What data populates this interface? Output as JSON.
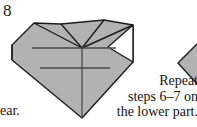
{
  "page": {
    "background_color": "#ffffff",
    "width": 197,
    "height": 127,
    "kind": "origami-instruction-diagram"
  },
  "step": {
    "number_label": "8"
  },
  "captions": {
    "left_fragment": "ear.",
    "right_lines": [
      "Repeat",
      "steps 6–7 on",
      "the lower part."
    ],
    "right_full_text": "Repeat steps 6–7 on the lower part."
  },
  "figure": {
    "name": "folded-paper-kite-shape",
    "paper_fill_color": "#b2b2b2",
    "paper_stroke_color": "#1c1c1c",
    "reveal_fill_color": "#ffffff",
    "crease_line_color": "#4a4a4a",
    "main_outline_points": "12,45 34,23 61,24 104,20 133,25 133,62 82,118 12,60",
    "white_notch_points": "133,25 133,62 108,47",
    "fold_flap_points": "12,45 34,23 82,48",
    "fold_top_left_points": "34,23 61,24 82,48",
    "fold_top_right_points": "61,24 104,20 82,48",
    "crease_horizontal_upper": {
      "x1": 32,
      "y1": 48,
      "x2": 116,
      "y2": 48
    },
    "crease_horizontal_lower": {
      "x1": 40,
      "y1": 68,
      "x2": 110,
      "y2": 68
    },
    "crease_vertical": {
      "x1": 82,
      "y1": 48,
      "x2": 82,
      "y2": 116
    }
  },
  "next_figure": {
    "name": "adjacent-figure-partial",
    "fill_color": "#b2b2b2",
    "stroke_color": "#1c1c1c",
    "points": "197,44 179,63 197,84"
  }
}
